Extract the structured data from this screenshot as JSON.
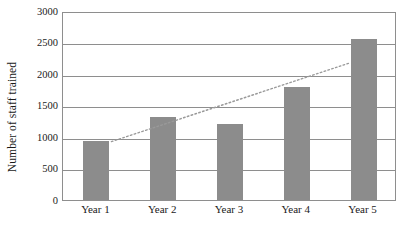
{
  "chart_data": {
    "type": "bar",
    "title": "",
    "xlabel": "",
    "ylabel": "Number of staff trained",
    "categories": [
      "Year 1",
      "Year 2",
      "Year 3",
      "Year 4",
      "Year 5"
    ],
    "values": [
      940,
      1310,
      1200,
      1790,
      2560
    ],
    "series": [
      {
        "name": "Number of staff trained",
        "type": "bar",
        "values": [
          940,
          1310,
          1200,
          1790,
          2560
        ],
        "color": "#8c8c8c"
      },
      {
        "name": "Linear trend",
        "type": "line",
        "style": "dotted",
        "color": "#9a9a9a",
        "values": [
          880,
          1230,
          1580,
          1930,
          2280
        ]
      }
    ],
    "ylim": [
      0,
      3000
    ],
    "yticks": [
      0,
      500,
      1000,
      1500,
      2000,
      2500,
      3000
    ],
    "ytick_labels": [
      "0",
      "500",
      "1000",
      "1500",
      "2000",
      "2500",
      "3000"
    ],
    "grid": "horizontal",
    "legend": "none",
    "frame": true
  },
  "axis": {
    "y_title": "Number of staff trained"
  }
}
